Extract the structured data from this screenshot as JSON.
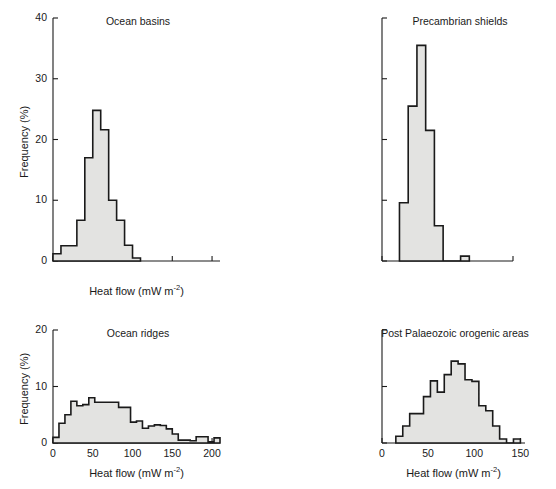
{
  "figure": {
    "axis_label_x": "Heat flow (mW m",
    "axis_label_x_exp": "-2",
    "axis_label_x_close": ")",
    "axis_label_y": "Frequency (%)",
    "line_color": "#1a1a1a",
    "fill_color": "#e3e3e1"
  },
  "chart_data": [
    {
      "type": "bar",
      "title": "Ocean basins",
      "panel": "top-left",
      "xlabel": "Heat flow (mW m-2)",
      "ylabel": "Frequency (%)",
      "xlim": [
        0,
        210
      ],
      "ylim": [
        0,
        40
      ],
      "xticks": [
        0,
        50,
        100,
        150,
        200
      ],
      "xtick_labels": [
        "",
        "",
        "",
        "",
        ""
      ],
      "yticks": [
        0,
        10,
        20,
        30,
        40
      ],
      "ytick_labels": [
        "0",
        "10",
        "20",
        "30",
        "40"
      ],
      "bin_width": 10,
      "bin_starts": [
        0,
        10,
        20,
        30,
        40,
        50,
        60,
        70,
        80,
        90
      ],
      "values": [
        1.2,
        2.5,
        2.5,
        6.7,
        17.0,
        24.8,
        21.6,
        10.0,
        6.7,
        2.6,
        0.5
      ],
      "grid": false,
      "legend": false
    },
    {
      "type": "bar",
      "title": "Precambrian shields",
      "panel": "top-right",
      "xlabel": "",
      "ylabel": "",
      "xlim": [
        0,
        150
      ],
      "ylim": [
        0,
        40
      ],
      "xticks": [
        0,
        50,
        100,
        150
      ],
      "xtick_labels": [
        "",
        "",
        "",
        ""
      ],
      "yticks": [
        0,
        10,
        20,
        30,
        40
      ],
      "ytick_labels": [
        "",
        "",
        "",
        "",
        ""
      ],
      "bin_width": 10,
      "bin_starts": [
        20,
        30,
        40,
        50,
        60,
        90
      ],
      "values": [
        9.6,
        25.5,
        35.5,
        21.5,
        5.8,
        0.8
      ],
      "grid": false,
      "legend": false
    },
    {
      "type": "bar",
      "title": "Ocean ridges",
      "panel": "bottom-left",
      "xlabel": "Heat flow (mW m-2)",
      "ylabel": "Frequency (%)",
      "xlim": [
        0,
        210
      ],
      "ylim": [
        0,
        20
      ],
      "xticks": [
        0,
        50,
        100,
        150,
        200
      ],
      "xtick_labels": [
        "0",
        "50",
        "100",
        "150",
        "200"
      ],
      "yticks": [
        0,
        10,
        20
      ],
      "ytick_labels": [
        "0",
        "10",
        "20"
      ],
      "bin_width": 7.5,
      "bin_starts": [
        0,
        7.5,
        15,
        22.5,
        30,
        37.5,
        45,
        52.5,
        60,
        67.5,
        75,
        82.5,
        90,
        97.5,
        105,
        112.5,
        120,
        127.5,
        135,
        142.5,
        150,
        157.5,
        165,
        172.5,
        180,
        187.5,
        195,
        202.5
      ],
      "values": [
        1.0,
        3.5,
        5.0,
        7.4,
        6.6,
        6.8,
        8.0,
        7.2,
        7.2,
        7.2,
        7.2,
        6.3,
        6.3,
        3.7,
        3.9,
        2.6,
        3.0,
        3.2,
        3.1,
        2.5,
        1.6,
        0.5,
        0.5,
        0.4,
        1.1,
        1.1,
        0.2,
        0.9
      ],
      "grid": false,
      "legend": false
    },
    {
      "type": "bar",
      "title": "Post Palaeozoic orogenic areas",
      "panel": "bottom-right",
      "xlabel": "Heat flow (mW m-2)",
      "ylabel": "",
      "xlim": [
        0,
        155
      ],
      "ylim": [
        0,
        20
      ],
      "xticks": [
        0,
        50,
        100,
        150
      ],
      "xtick_labels": [
        "0",
        "50",
        "100",
        "150"
      ],
      "yticks": [
        0,
        10,
        20
      ],
      "ytick_labels": [
        "",
        "",
        ""
      ],
      "bin_width": 7.5,
      "bin_starts": [
        15,
        22.5,
        30,
        37.5,
        45,
        52.5,
        60,
        67.5,
        75,
        82.5,
        90,
        97.5,
        105,
        112.5,
        120,
        127.5,
        142.5
      ],
      "values": [
        1.2,
        3.0,
        5.2,
        5.2,
        8.2,
        11.0,
        9.0,
        12.1,
        14.5,
        14.0,
        11.2,
        10.9,
        6.6,
        5.7,
        3.0,
        0.7,
        0.7
      ],
      "grid": false,
      "legend": false
    }
  ]
}
